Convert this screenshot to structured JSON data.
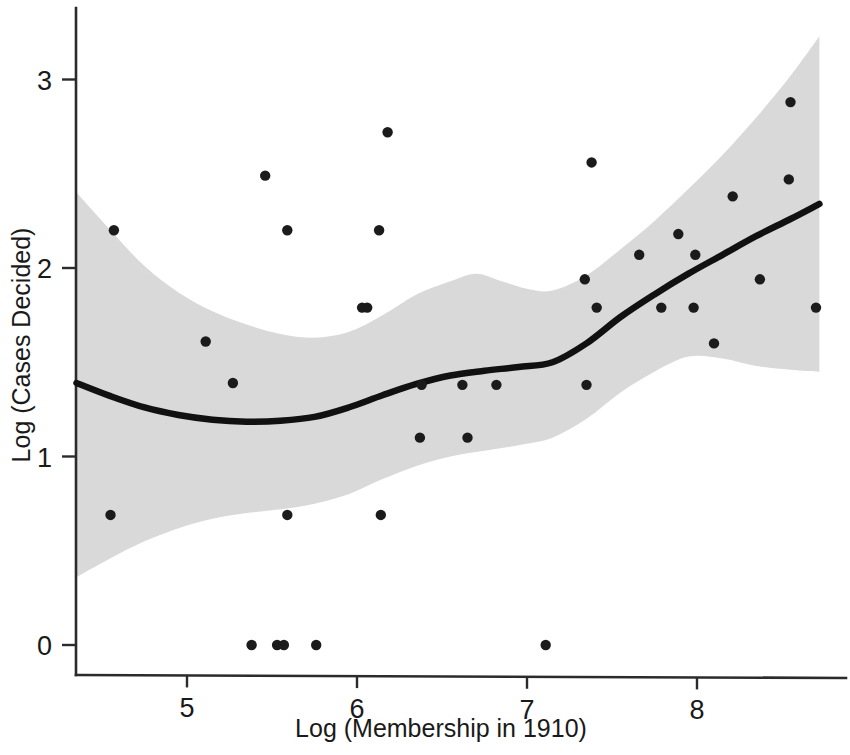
{
  "chart_data": {
    "type": "scatter",
    "title": "",
    "xlabel": "Log (Membership in 1910)",
    "ylabel": "Log (Cases Decided)",
    "xlim": [
      4.35,
      8.75
    ],
    "ylim": [
      -0.2,
      3.43
    ],
    "xticks": [
      5,
      6,
      7,
      8
    ],
    "xtick_labels": [
      "5",
      "6",
      "7",
      "8"
    ],
    "yticks": [
      0,
      1,
      2,
      3
    ],
    "ytick_labels": [
      "0",
      "1",
      "2",
      "3"
    ],
    "grid": false,
    "legend": "none",
    "series": [
      {
        "name": "observations",
        "type": "scatter",
        "marker": "filled-circle",
        "color": "#1b1b1b",
        "points": [
          [
            4.55,
            0.69
          ],
          [
            4.57,
            2.2
          ],
          [
            5.11,
            1.61
          ],
          [
            5.27,
            1.39
          ],
          [
            5.38,
            0.0
          ],
          [
            5.46,
            2.49
          ],
          [
            5.53,
            0.0
          ],
          [
            5.57,
            0.0
          ],
          [
            5.59,
            0.69
          ],
          [
            5.59,
            2.2
          ],
          [
            5.76,
            0.0
          ],
          [
            6.03,
            1.79
          ],
          [
            6.06,
            1.79
          ],
          [
            6.13,
            2.2
          ],
          [
            6.14,
            0.69
          ],
          [
            6.18,
            2.72
          ],
          [
            6.37,
            1.1
          ],
          [
            6.38,
            1.38
          ],
          [
            6.62,
            1.38
          ],
          [
            6.65,
            1.1
          ],
          [
            6.82,
            1.38
          ],
          [
            7.11,
            0.0
          ],
          [
            7.34,
            1.94
          ],
          [
            7.35,
            1.38
          ],
          [
            7.38,
            2.56
          ],
          [
            7.41,
            1.79
          ],
          [
            7.66,
            2.07
          ],
          [
            7.79,
            1.79
          ],
          [
            7.89,
            2.18
          ],
          [
            7.98,
            1.79
          ],
          [
            7.99,
            2.07
          ],
          [
            8.1,
            1.6
          ],
          [
            8.21,
            2.38
          ],
          [
            8.37,
            1.94
          ],
          [
            8.54,
            2.47
          ],
          [
            8.55,
            2.88
          ],
          [
            8.7,
            1.79
          ]
        ]
      },
      {
        "name": "loess-fit",
        "type": "line",
        "color": "#111111",
        "points": [
          [
            4.35,
            1.39
          ],
          [
            4.55,
            1.32
          ],
          [
            4.75,
            1.26
          ],
          [
            4.95,
            1.22
          ],
          [
            5.15,
            1.195
          ],
          [
            5.35,
            1.185
          ],
          [
            5.55,
            1.19
          ],
          [
            5.75,
            1.21
          ],
          [
            5.95,
            1.26
          ],
          [
            6.15,
            1.325
          ],
          [
            6.35,
            1.385
          ],
          [
            6.55,
            1.43
          ],
          [
            6.75,
            1.455
          ],
          [
            6.95,
            1.475
          ],
          [
            7.15,
            1.5
          ],
          [
            7.35,
            1.6
          ],
          [
            7.55,
            1.74
          ],
          [
            7.75,
            1.86
          ],
          [
            7.95,
            1.97
          ],
          [
            8.15,
            2.07
          ],
          [
            8.35,
            2.17
          ],
          [
            8.55,
            2.26
          ],
          [
            8.72,
            2.34
          ]
        ]
      },
      {
        "name": "confidence-band-upper",
        "type": "band-edge",
        "color": "#d9d9d9",
        "points": [
          [
            4.35,
            2.4
          ],
          [
            4.55,
            2.2
          ],
          [
            4.75,
            2.01
          ],
          [
            4.95,
            1.87
          ],
          [
            5.15,
            1.77
          ],
          [
            5.35,
            1.7
          ],
          [
            5.55,
            1.65
          ],
          [
            5.75,
            1.63
          ],
          [
            5.95,
            1.66
          ],
          [
            6.15,
            1.75
          ],
          [
            6.35,
            1.86
          ],
          [
            6.55,
            1.93
          ],
          [
            6.7,
            1.97
          ],
          [
            6.85,
            1.93
          ],
          [
            7.0,
            1.89
          ],
          [
            7.15,
            1.88
          ],
          [
            7.35,
            1.96
          ],
          [
            7.55,
            2.1
          ],
          [
            7.75,
            2.25
          ],
          [
            7.95,
            2.42
          ],
          [
            8.15,
            2.6
          ],
          [
            8.35,
            2.8
          ],
          [
            8.55,
            3.02
          ],
          [
            8.72,
            3.23
          ]
        ]
      },
      {
        "name": "confidence-band-lower",
        "type": "band-edge",
        "color": "#d9d9d9",
        "points": [
          [
            4.35,
            0.36
          ],
          [
            4.55,
            0.46
          ],
          [
            4.75,
            0.55
          ],
          [
            4.95,
            0.62
          ],
          [
            5.15,
            0.67
          ],
          [
            5.35,
            0.7
          ],
          [
            5.55,
            0.72
          ],
          [
            5.75,
            0.75
          ],
          [
            5.95,
            0.8
          ],
          [
            6.15,
            0.88
          ],
          [
            6.35,
            0.95
          ],
          [
            6.55,
            1.0
          ],
          [
            6.75,
            1.03
          ],
          [
            6.95,
            1.06
          ],
          [
            7.15,
            1.1
          ],
          [
            7.35,
            1.2
          ],
          [
            7.55,
            1.34
          ],
          [
            7.75,
            1.45
          ],
          [
            7.95,
            1.53
          ],
          [
            8.15,
            1.52
          ],
          [
            8.35,
            1.48
          ],
          [
            8.55,
            1.46
          ],
          [
            8.72,
            1.45
          ]
        ]
      }
    ]
  }
}
